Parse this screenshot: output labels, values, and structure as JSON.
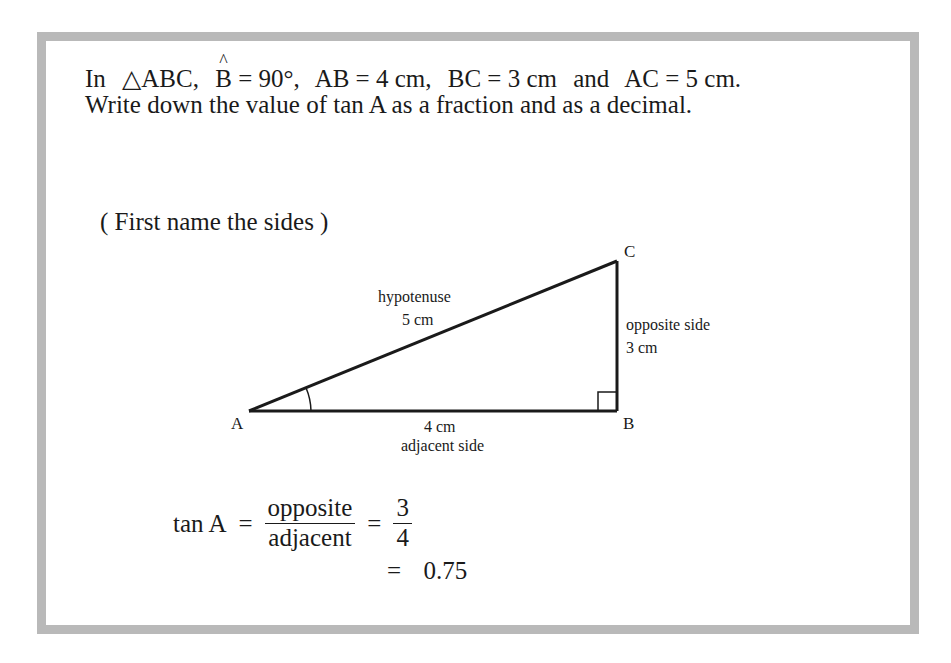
{
  "problem": {
    "line1": {
      "prefix": "In",
      "triangle": "△ABC,",
      "angle_vertex": "B",
      "angle_hat": "^",
      "angle_value": "= 90°,",
      "ab": "AB = 4 cm,",
      "bc": "BC = 3 cm",
      "conj": "and",
      "ac": "AC = 5 cm."
    },
    "line2": "Write down the value of tan A as a fraction and as a decimal."
  },
  "instruction": "( First name the sides )",
  "diagram": {
    "vertices": {
      "A": {
        "label": "A",
        "x": 249,
        "y": 411
      },
      "B": {
        "label": "B",
        "x": 617,
        "y": 411
      },
      "C": {
        "label": "C",
        "x": 617,
        "y": 261
      }
    },
    "hypotenuse": {
      "name": "hypotenuse",
      "length": "5 cm"
    },
    "opposite": {
      "name": "opposite side",
      "length": "3 cm"
    },
    "adjacent": {
      "name": "adjacent side",
      "length": "4 cm"
    },
    "right_angle_at": "B",
    "marked_angle_at": "A"
  },
  "solution": {
    "lhs": "tan A",
    "eq1": "=",
    "frac_num": "opposite",
    "frac_den": "adjacent",
    "eq2": "=",
    "val_num": "3",
    "val_den": "4",
    "eq3": "=",
    "decimal": "0.75"
  },
  "colors": {
    "border": "#b9b9b9",
    "ink": "#1a1a1a",
    "background": "#ffffff"
  }
}
